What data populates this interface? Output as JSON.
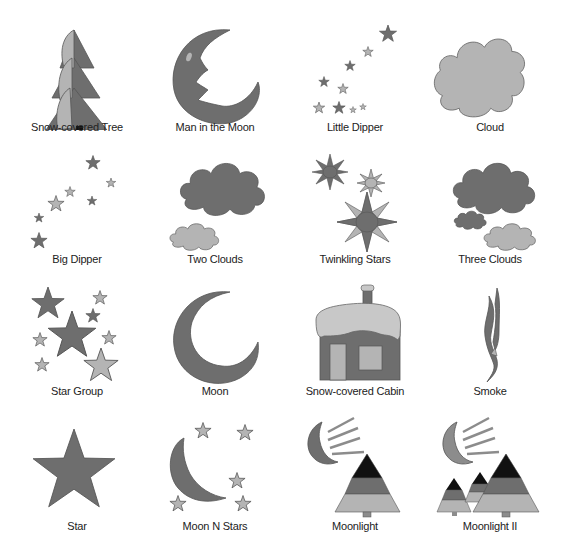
{
  "palette": {
    "dark": "#6e6e6e",
    "medium": "#8c8c8c",
    "light": "#b4b4b4",
    "lighter": "#c8c8c8",
    "black": "#111111",
    "outline": "#555555"
  },
  "items": [
    {
      "label": "Snow-covered Tree",
      "icon": "snow-covered-tree-icon"
    },
    {
      "label": "Man in the Moon",
      "icon": "man-in-the-moon-icon"
    },
    {
      "label": "Little Dipper",
      "icon": "little-dipper-icon"
    },
    {
      "label": "Cloud",
      "icon": "cloud-icon"
    },
    {
      "label": "Big Dipper",
      "icon": "big-dipper-icon"
    },
    {
      "label": "Two Clouds",
      "icon": "two-clouds-icon"
    },
    {
      "label": "Twinkling Stars",
      "icon": "twinkling-stars-icon"
    },
    {
      "label": "Three Clouds",
      "icon": "three-clouds-icon"
    },
    {
      "label": "Star Group",
      "icon": "star-group-icon"
    },
    {
      "label": "Moon",
      "icon": "moon-icon"
    },
    {
      "label": "Snow-covered Cabin",
      "icon": "snow-covered-cabin-icon"
    },
    {
      "label": "Smoke",
      "icon": "smoke-icon"
    },
    {
      "label": "Star",
      "icon": "star-icon"
    },
    {
      "label": "Moon N Stars",
      "icon": "moon-n-stars-icon"
    },
    {
      "label": "Moonlight",
      "icon": "moonlight-icon"
    },
    {
      "label": "Moonlight II",
      "icon": "moonlight-ii-icon"
    }
  ]
}
